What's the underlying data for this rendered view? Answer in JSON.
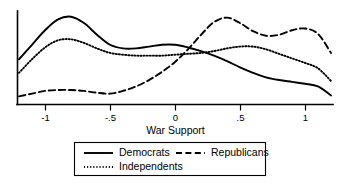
{
  "chart_data": {
    "type": "line",
    "title": "",
    "subtitle": "",
    "xlabel": "War Support",
    "ylabel": "",
    "xlim": [
      -1.2,
      1.2
    ],
    "ylim": [
      0,
      1.0
    ],
    "grid": false,
    "legend_position": "bottom",
    "xticks": [
      -1,
      -0.5,
      0,
      0.5,
      1
    ],
    "xtick_labels": [
      "-1",
      "-.5",
      "0",
      ".5",
      "1"
    ],
    "x": [
      -1.2,
      -1.1,
      -1.0,
      -0.9,
      -0.8,
      -0.7,
      -0.6,
      -0.5,
      -0.4,
      -0.3,
      -0.2,
      -0.1,
      0.0,
      0.1,
      0.2,
      0.3,
      0.4,
      0.5,
      0.6,
      0.7,
      0.8,
      0.9,
      1.0,
      1.1,
      1.2
    ],
    "series": [
      {
        "name": "Democrats",
        "style": "solid",
        "values": [
          0.5,
          0.66,
          0.82,
          0.94,
          0.97,
          0.9,
          0.77,
          0.66,
          0.62,
          0.62,
          0.64,
          0.66,
          0.66,
          0.63,
          0.59,
          0.54,
          0.48,
          0.41,
          0.35,
          0.3,
          0.27,
          0.25,
          0.23,
          0.2,
          0.1
        ]
      },
      {
        "name": "Republicans",
        "style": "dashed",
        "values": [
          0.09,
          0.12,
          0.15,
          0.16,
          0.16,
          0.15,
          0.13,
          0.12,
          0.15,
          0.2,
          0.27,
          0.36,
          0.47,
          0.61,
          0.77,
          0.91,
          0.96,
          0.9,
          0.81,
          0.76,
          0.77,
          0.82,
          0.84,
          0.78,
          0.57
        ]
      },
      {
        "name": "Independents",
        "style": "dotted",
        "values": [
          0.35,
          0.5,
          0.63,
          0.71,
          0.72,
          0.68,
          0.62,
          0.57,
          0.55,
          0.54,
          0.54,
          0.54,
          0.55,
          0.56,
          0.57,
          0.59,
          0.62,
          0.64,
          0.64,
          0.61,
          0.56,
          0.51,
          0.46,
          0.4,
          0.26
        ]
      }
    ],
    "legend": [
      {
        "label": "Democrats",
        "style": "solid"
      },
      {
        "label": "Republicans",
        "style": "dashed"
      },
      {
        "label": "Independents",
        "style": "dotted"
      }
    ]
  }
}
